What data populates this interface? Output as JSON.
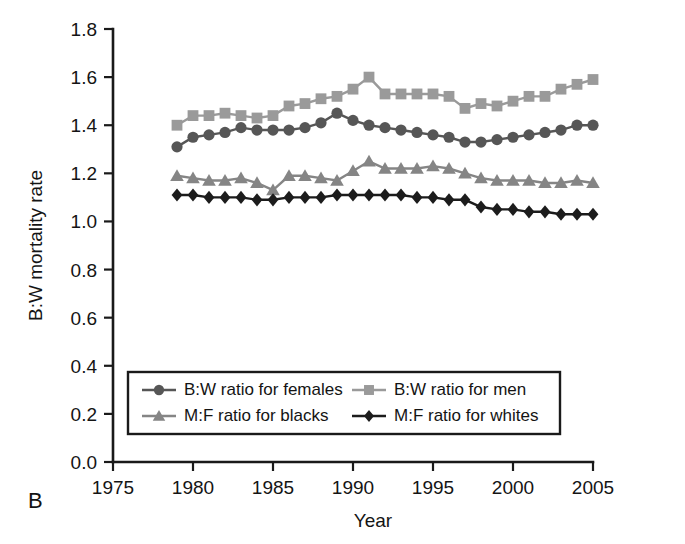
{
  "panel_label": "B",
  "chart_data": {
    "type": "line",
    "title": "",
    "xlabel": "Year",
    "ylabel": "B:W mortality rate",
    "xlim": [
      1975,
      2005
    ],
    "ylim": [
      0.0,
      1.8
    ],
    "xticks": [
      1975,
      1980,
      1985,
      1990,
      1995,
      2000,
      2005
    ],
    "xtick_labels": [
      "1975",
      "1980",
      "1985",
      "1990",
      "1995",
      "2000",
      "2005"
    ],
    "yticks": [
      0.0,
      0.2,
      0.4,
      0.6,
      0.8,
      1.0,
      1.2,
      1.4,
      1.6,
      1.8
    ],
    "ytick_labels": [
      "0.0",
      "0.2",
      "0.4",
      "0.6",
      "0.8",
      "1.0",
      "1.2",
      "1.4",
      "1.6",
      "1.8"
    ],
    "grid": false,
    "legend_position": "lower-center",
    "x": [
      1979,
      1980,
      1981,
      1982,
      1983,
      1984,
      1985,
      1986,
      1987,
      1988,
      1989,
      1990,
      1991,
      1992,
      1993,
      1994,
      1995,
      1996,
      1997,
      1998,
      1999,
      2000,
      2001,
      2002,
      2003,
      2004,
      2005
    ],
    "series": [
      {
        "name": "B:W ratio for females",
        "marker": "circle",
        "color": "#565656",
        "values": [
          1.31,
          1.35,
          1.36,
          1.37,
          1.39,
          1.38,
          1.38,
          1.38,
          1.39,
          1.41,
          1.45,
          1.42,
          1.4,
          1.39,
          1.38,
          1.37,
          1.36,
          1.35,
          1.33,
          1.33,
          1.34,
          1.35,
          1.36,
          1.37,
          1.38,
          1.4,
          1.4
        ]
      },
      {
        "name": "B:W ratio for men",
        "marker": "square",
        "color": "#9a9a9a",
        "values": [
          1.4,
          1.44,
          1.44,
          1.45,
          1.44,
          1.43,
          1.44,
          1.48,
          1.49,
          1.51,
          1.52,
          1.55,
          1.6,
          1.53,
          1.53,
          1.53,
          1.53,
          1.52,
          1.47,
          1.49,
          1.48,
          1.5,
          1.52,
          1.52,
          1.55,
          1.57,
          1.59
        ]
      },
      {
        "name": "M:F ratio for blacks",
        "marker": "triangle",
        "color": "#858585",
        "values": [
          1.19,
          1.18,
          1.17,
          1.17,
          1.18,
          1.16,
          1.13,
          1.19,
          1.19,
          1.18,
          1.17,
          1.21,
          1.25,
          1.22,
          1.22,
          1.22,
          1.23,
          1.22,
          1.2,
          1.18,
          1.17,
          1.17,
          1.17,
          1.16,
          1.16,
          1.17,
          1.16
        ]
      },
      {
        "name": "M:F ratio for whites",
        "marker": "diamond",
        "color": "#1c1c1c",
        "values": [
          1.11,
          1.11,
          1.1,
          1.1,
          1.1,
          1.09,
          1.09,
          1.1,
          1.1,
          1.1,
          1.11,
          1.11,
          1.11,
          1.11,
          1.11,
          1.1,
          1.1,
          1.09,
          1.09,
          1.06,
          1.05,
          1.05,
          1.04,
          1.04,
          1.03,
          1.03,
          1.03
        ]
      }
    ]
  }
}
